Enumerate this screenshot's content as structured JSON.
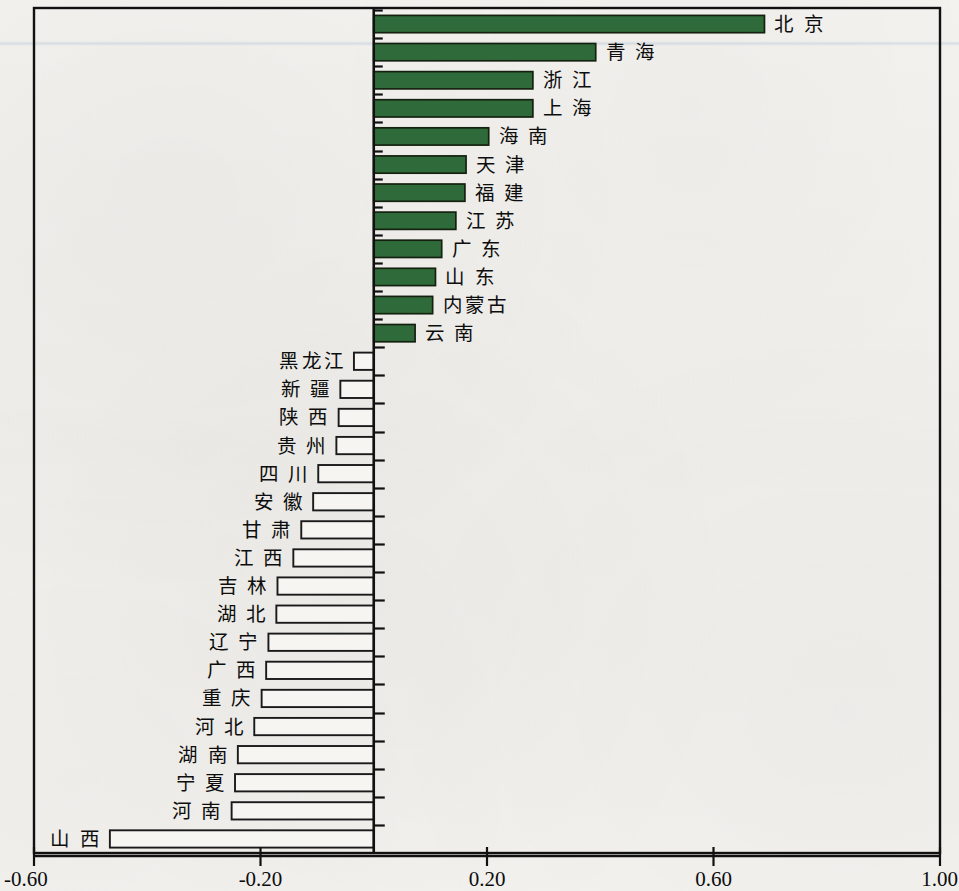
{
  "chart_data": {
    "type": "bar",
    "orientation": "horizontal",
    "title": "",
    "subtitle": "",
    "xlabel": "",
    "ylabel": "",
    "xlim": [
      -0.6,
      1.0
    ],
    "xticks": [
      -0.6,
      -0.2,
      0.2,
      0.6,
      1.0
    ],
    "xtick_labels": [
      "-0.60",
      "-0.20",
      "0.20",
      "0.60",
      "1.00"
    ],
    "grid": false,
    "legend": "none",
    "positive_color": "#2f6b3a",
    "negative_color": "#f6f5f2",
    "border_color": "#111111",
    "categories": [
      "北 京",
      "青 海",
      "浙 江",
      "上 海",
      "海 南",
      "天 津",
      "福 建",
      "江 苏",
      "广 东",
      "山 东",
      "内蒙古",
      "云 南",
      "黑龙江",
      "新 疆",
      "陕 西",
      "贵 州",
      "四 川",
      "安 徽",
      "甘 肃",
      "江 西",
      "吉 林",
      "湖 北",
      "辽 宁",
      "广 西",
      "重 庆",
      "河 北",
      "湖 南",
      "宁 夏",
      "河 南",
      "山 西"
    ],
    "values": [
      0.69,
      0.392,
      0.281,
      0.281,
      0.203,
      0.163,
      0.161,
      0.145,
      0.12,
      0.109,
      0.104,
      0.073,
      -0.035,
      -0.059,
      -0.062,
      -0.066,
      -0.098,
      -0.107,
      -0.128,
      -0.142,
      -0.17,
      -0.172,
      -0.186,
      -0.19,
      -0.198,
      -0.211,
      -0.24,
      -0.245,
      -0.251,
      -0.466
    ]
  }
}
